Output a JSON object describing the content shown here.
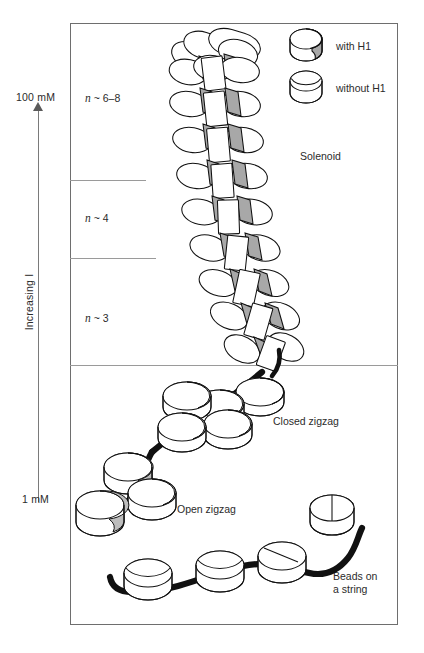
{
  "figure": {
    "type": "diagram"
  },
  "axis": {
    "top_label": "100 mM",
    "bottom_label": "1 mM",
    "rotated_label": "Increasing I",
    "direction": "upward-arrow"
  },
  "bands": [
    {
      "n_label": "n ~ 6-8",
      "n_symbol": "n",
      "n_value": "~ 6-8"
    },
    {
      "n_label": "n ~ 4",
      "n_symbol": "n",
      "n_value": "~ 4"
    },
    {
      "n_label": "n ~ 3",
      "n_symbol": "n",
      "n_value": "~ 3"
    }
  ],
  "structures": [
    {
      "name": "Solenoid",
      "label": "Solenoid"
    },
    {
      "name": "Closed zigzag",
      "label": "Closed zigzag"
    },
    {
      "name": "Open zigzag",
      "label": "Open zigzag"
    },
    {
      "name": "Beads on a string",
      "label_line1": "Beads on",
      "label_line2": "a string"
    }
  ],
  "legend": {
    "items": [
      {
        "icon": "nucleosome-shaded-icon",
        "label": "with H1"
      },
      {
        "icon": "nucleosome-plain-icon",
        "label": "without H1"
      }
    ]
  },
  "colors": {
    "ink": "#111111",
    "frame": "#6e6e6e",
    "shade": "#a8a8a8",
    "paper": "#ffffff"
  }
}
